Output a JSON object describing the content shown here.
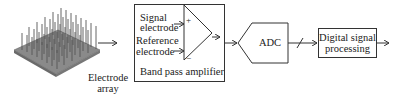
{
  "diagram": {
    "electrode_array": {
      "label_line1": "Electrode",
      "label_line2": "array"
    },
    "amplifier": {
      "title": "Band pass amplifier",
      "input_plus_label": "Signal",
      "input_plus_label2": "electrode",
      "input_minus_label": "Reference",
      "input_minus_label2": "electrode",
      "plus_sign": "+",
      "minus_sign": "−"
    },
    "adc": {
      "label": "ADC"
    },
    "dsp": {
      "label_line1": "Digital signal",
      "label_line2": "processing"
    },
    "colors": {
      "line": "#333333",
      "array": "#7a7a7a",
      "background": "#ffffff"
    }
  }
}
